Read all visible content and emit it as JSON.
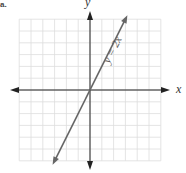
{
  "corner_label": "a.",
  "chart_data": {
    "type": "line",
    "title": "",
    "xlabel": "x",
    "ylabel": "y",
    "grid": true,
    "xlim": [
      -6,
      6
    ],
    "ylim": [
      -6,
      6
    ],
    "series": [
      {
        "name": "y = 2x",
        "label": "y = 2x",
        "x": [
          -3,
          -2,
          -1,
          0,
          1,
          2,
          3
        ],
        "y": [
          -6,
          -4,
          -2,
          0,
          2,
          4,
          6
        ]
      }
    ],
    "colors": {
      "line": "#666666",
      "axes": "#222222",
      "grid": "#dddddd"
    }
  }
}
